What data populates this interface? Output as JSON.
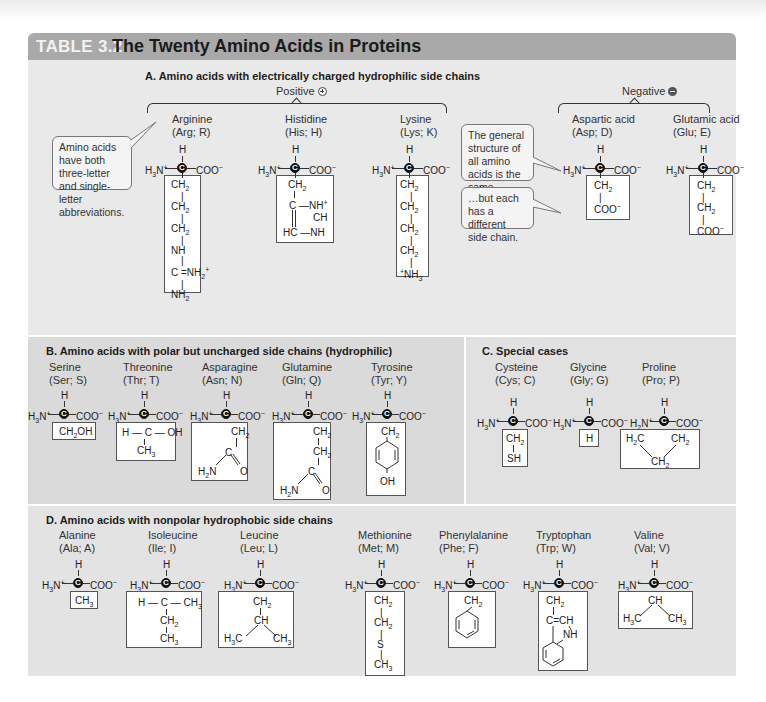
{
  "table": {
    "number": "TABLE 3.2",
    "title": "The Twenty Amino Acids in Proteins"
  },
  "sections": {
    "A": {
      "heading": "A.  Amino acids with electrically charged hydrophilic side chains",
      "positive_label": "Positive",
      "negative_label": "Negative",
      "positive_icon": "plus-circle-icon",
      "negative_icon": "minus-circle-icon",
      "callouts": {
        "abbreviations": "Amino acids have both three-letter and single-letter abbreviations.",
        "general_structure": "The general structure of all amino acids is the same…",
        "side_chain": "…but each has a different side chain."
      },
      "acids": [
        {
          "name": "Arginine",
          "abbr": "(Arg; R)",
          "side_chain": [
            "CH2",
            "CH2",
            "CH2",
            "NH",
            "C=NH2+",
            "NH2"
          ]
        },
        {
          "name": "Histidine",
          "abbr": "(His; H)",
          "side_chain": [
            "CH2",
            "C—NH+",
            "CH",
            "HC—NH"
          ]
        },
        {
          "name": "Lysine",
          "abbr": "(Lys; K)",
          "side_chain": [
            "CH2",
            "CH2",
            "CH2",
            "CH2",
            "+NH3"
          ]
        },
        {
          "name": "Aspartic acid",
          "abbr": "(Asp; D)",
          "side_chain": [
            "CH2",
            "COO-"
          ]
        },
        {
          "name": "Glutamic acid",
          "abbr": "(Glu; E)",
          "side_chain": [
            "CH2",
            "CH2",
            "COO-"
          ]
        }
      ]
    },
    "B": {
      "heading": "B.  Amino acids with polar but uncharged side chains (hydrophilic)",
      "acids": [
        {
          "name": "Serine",
          "abbr": "(Ser; S)",
          "side_chain": [
            "CH2OH"
          ]
        },
        {
          "name": "Threonine",
          "abbr": "(Thr; T)",
          "side_chain": [
            "H—C—OH",
            "CH3"
          ]
        },
        {
          "name": "Asparagine",
          "abbr": "(Asn; N)",
          "side_chain": [
            "CH2",
            "C",
            "H2N",
            "O"
          ]
        },
        {
          "name": "Glutamine",
          "abbr": "(Gln; Q)",
          "side_chain": [
            "CH2",
            "CH2",
            "C",
            "H2N",
            "O"
          ]
        },
        {
          "name": "Tyrosine",
          "abbr": "(Tyr; Y)",
          "side_chain": [
            "CH2",
            "benzene-ring",
            "OH"
          ]
        }
      ]
    },
    "C": {
      "heading": "C.  Special cases",
      "acids": [
        {
          "name": "Cysteine",
          "abbr": "(Cys; C)",
          "side_chain": [
            "CH2",
            "SH"
          ]
        },
        {
          "name": "Glycine",
          "abbr": "(Gly; G)",
          "side_chain": [
            "H"
          ]
        },
        {
          "name": "Proline",
          "abbr": "(Pro; P)",
          "side_chain": [
            "H2C",
            "CH2",
            "CH2"
          ]
        }
      ]
    },
    "D": {
      "heading": "D.  Amino acids with nonpolar hydrophobic side chains",
      "acids": [
        {
          "name": "Alanine",
          "abbr": "(Ala; A)",
          "side_chain": [
            "CH3"
          ]
        },
        {
          "name": "Isoleucine",
          "abbr": "(Ile; I)",
          "side_chain": [
            "H—C—CH3",
            "CH2",
            "CH3"
          ]
        },
        {
          "name": "Leucine",
          "abbr": "(Leu; L)",
          "side_chain": [
            "CH2",
            "CH",
            "H3C",
            "CH3"
          ]
        },
        {
          "name": "Methionine",
          "abbr": "(Met; M)",
          "side_chain": [
            "CH2",
            "CH2",
            "S",
            "CH3"
          ]
        },
        {
          "name": "Phenylalanine",
          "abbr": "(Phe; F)",
          "side_chain": [
            "CH2",
            "benzene-ring"
          ]
        },
        {
          "name": "Tryptophan",
          "abbr": "(Trp; W)",
          "side_chain": [
            "CH2",
            "C=CH",
            "NH",
            "indole-ring"
          ]
        },
        {
          "name": "Valine",
          "abbr": "(Val; V)",
          "side_chain": [
            "CH",
            "H3C",
            "CH3"
          ]
        }
      ]
    }
  },
  "backbone": {
    "alpha_h": "H",
    "amino": "H3N+",
    "carboxyl": "COO-",
    "alpha_c": "C"
  }
}
